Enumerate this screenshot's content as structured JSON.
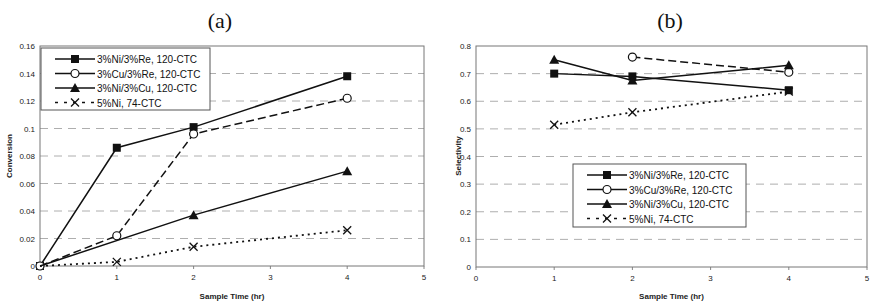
{
  "chart_data": [
    {
      "panel_label": "(a)",
      "type": "line",
      "title": "",
      "xlabel": "Sample Time (hr)",
      "ylabel": "Conversion",
      "xlim": [
        0,
        5
      ],
      "ylim": [
        0,
        0.16
      ],
      "xticks": [
        "0",
        "1",
        "2",
        "3",
        "4",
        "5"
      ],
      "yticks": [
        "0",
        "0.02",
        "0.04",
        "0.06",
        "0.08",
        "0.1",
        "0.12",
        "0.14",
        "0.16"
      ],
      "grid": "horizontal dashed",
      "legend_position": "upper left",
      "series": [
        {
          "name": "3%Ni/3%Re, 120-CTC",
          "marker": "filled-square",
          "line": "solid",
          "x": [
            0,
            1,
            2,
            4
          ],
          "values": [
            0,
            0.086,
            0.101,
            0.138
          ]
        },
        {
          "name": "3%Cu/3%Re, 120-CTC",
          "marker": "open-circle",
          "line": "dashed",
          "x": [
            0,
            1,
            2,
            4
          ],
          "values": [
            0,
            0.022,
            0.096,
            0.122
          ]
        },
        {
          "name": "3%Ni/3%Cu, 120-CTC",
          "marker": "filled-triangle",
          "line": "solid",
          "x": [
            0,
            2,
            4
          ],
          "values": [
            0,
            0.037,
            0.069
          ]
        },
        {
          "name": "5%Ni, 74-CTC",
          "marker": "x",
          "line": "dotted",
          "x": [
            0,
            1,
            2,
            4
          ],
          "values": [
            0,
            0.003,
            0.014,
            0.026
          ]
        }
      ]
    },
    {
      "panel_label": "(b)",
      "type": "line",
      "title": "",
      "xlabel": "Sample Time (hr)",
      "ylabel": "Selectivity",
      "xlim": [
        0,
        5
      ],
      "ylim": [
        0,
        0.8
      ],
      "xticks": [
        "0",
        "1",
        "2",
        "3",
        "4",
        "5"
      ],
      "yticks": [
        "0",
        "0.1",
        "0.2",
        "0.3",
        "0.4",
        "0.5",
        "0.6",
        "0.7",
        "0.8"
      ],
      "grid": "horizontal dashed",
      "legend_position": "center",
      "series": [
        {
          "name": "3%Ni/3%Re, 120-CTC",
          "marker": "filled-square",
          "line": "solid",
          "x": [
            1,
            2,
            4
          ],
          "values": [
            0.7,
            0.69,
            0.64
          ]
        },
        {
          "name": "3%Cu/3%Re, 120-CTC",
          "marker": "open-circle",
          "line": "dashed",
          "x": [
            2,
            4
          ],
          "values": [
            0.76,
            0.705
          ]
        },
        {
          "name": "3%Ni/3%Cu, 120-CTC",
          "marker": "filled-triangle",
          "line": "solid",
          "x": [
            1,
            2,
            4
          ],
          "values": [
            0.75,
            0.675,
            0.73
          ]
        },
        {
          "name": "5%Ni, 74-CTC",
          "marker": "x",
          "line": "dotted",
          "x": [
            1,
            2,
            4
          ],
          "values": [
            0.515,
            0.56,
            0.635
          ]
        }
      ]
    }
  ],
  "layout": {
    "panels": [
      {
        "plot": {
          "x0": 40,
          "x1": 424,
          "y0": 46,
          "y1": 266
        },
        "title_x": 220,
        "title_y": 28,
        "legend": {
          "x": 41,
          "y": 48,
          "w": 169,
          "h": 62
        },
        "ylabel_x": 12,
        "ylabel_y": 156,
        "xlabel_y": 299
      },
      {
        "plot": {
          "x0": 476,
          "x1": 867,
          "y0": 46,
          "y1": 267
        },
        "title_x": 670,
        "title_y": 28,
        "legend": {
          "x": 573,
          "y": 164,
          "w": 173,
          "h": 63
        },
        "ylabel_x": 461,
        "ylabel_y": 156,
        "xlabel_y": 299
      }
    ]
  }
}
